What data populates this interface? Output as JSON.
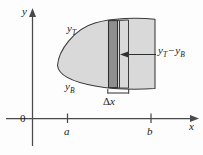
{
  "figure": {
    "name": "area-between-two-curves-diagram",
    "type": "diagram"
  },
  "axes": {
    "y_axis_label": "y",
    "x_axis_label": "x",
    "origin_label": "0",
    "ticks": [
      {
        "label": "a",
        "axis": "x"
      },
      {
        "label": "b",
        "axis": "x"
      }
    ]
  },
  "curves": {
    "top_label": "y",
    "top_subscript": "T",
    "bottom_label": "y",
    "bottom_subscript": "B"
  },
  "strip": {
    "width_label_prefix": "Δ",
    "width_label_var": "x",
    "height_label": {
      "first_var": "y",
      "first_sub": "T",
      "operator": "−",
      "second_var": "y",
      "second_sub": "B"
    }
  },
  "colors": {
    "region_fill": "#d9d9d9",
    "strip_fill": "#8f8f8f",
    "outline": "#3a3a3a",
    "axis": "#4a4a4a",
    "text": "#1b1b1b",
    "background": "#fdfdfd"
  }
}
